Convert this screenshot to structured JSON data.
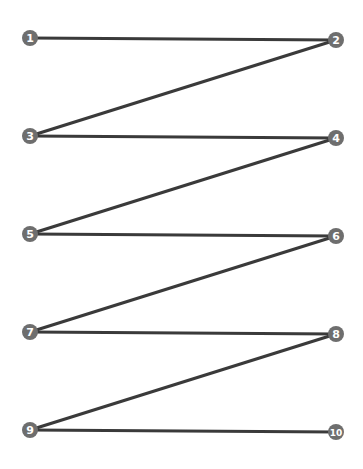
{
  "diagram": {
    "type": "zigzag-path",
    "line_color": "#3a3a3a",
    "node_color": "#6e6e6e",
    "node_text_color": "#ffffff",
    "nodes": [
      {
        "label": "1",
        "x": 30,
        "y": 38
      },
      {
        "label": "2",
        "x": 336,
        "y": 40
      },
      {
        "label": "3",
        "x": 30,
        "y": 136
      },
      {
        "label": "4",
        "x": 336,
        "y": 138
      },
      {
        "label": "5",
        "x": 30,
        "y": 234
      },
      {
        "label": "6",
        "x": 336,
        "y": 236
      },
      {
        "label": "7",
        "x": 30,
        "y": 332
      },
      {
        "label": "8",
        "x": 336,
        "y": 334
      },
      {
        "label": "9",
        "x": 30,
        "y": 430
      },
      {
        "label": "10",
        "x": 336,
        "y": 432
      }
    ],
    "edges": [
      [
        0,
        1
      ],
      [
        1,
        2
      ],
      [
        2,
        3
      ],
      [
        3,
        4
      ],
      [
        4,
        5
      ],
      [
        5,
        6
      ],
      [
        6,
        7
      ],
      [
        7,
        8
      ],
      [
        8,
        9
      ]
    ]
  }
}
